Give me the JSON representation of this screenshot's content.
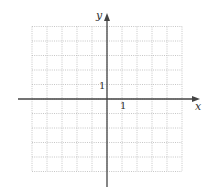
{
  "diagram": {
    "type": "coordinate-grid",
    "axes": {
      "x_label": "x",
      "y_label": "y",
      "x_tick_label": "1",
      "y_tick_label": "1"
    },
    "grid": {
      "x_min": -5,
      "x_max": 5,
      "y_min": -5,
      "y_max": 5,
      "step": 1,
      "style": "dotted"
    },
    "colors": {
      "axis": "#444444",
      "grid": "#b8b8b8",
      "background": "#ffffff"
    }
  }
}
